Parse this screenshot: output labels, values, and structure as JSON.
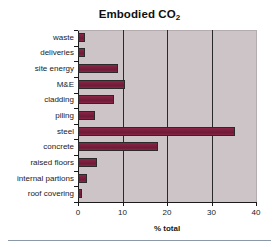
{
  "chart_data": {
    "type": "bar",
    "orientation": "horizontal",
    "title": "Embodied CO2",
    "title_main": "Embodied CO",
    "title_subscript": "2",
    "xlabel": "% total",
    "ylabel": "",
    "xlim": [
      0,
      40
    ],
    "xticks": [
      "0",
      "10",
      "20",
      "30",
      "40"
    ],
    "xtick_values": [
      0,
      10,
      20,
      30,
      40
    ],
    "gridlines": [
      10,
      20,
      30
    ],
    "grid": true,
    "legend": false,
    "bar_color": "#7a1f3d",
    "plot_background": "#ccc4c6",
    "figure_background": "#ffffff",
    "axis_color": "#1a1a1a",
    "categories": [
      "waste",
      "deliveries",
      "site energy",
      "M&E",
      "cladding",
      "piling",
      "steel",
      "concrete",
      "raised floors",
      "internal partions",
      "roof covering"
    ],
    "values": [
      1.6,
      1.6,
      9.0,
      10.5,
      8.0,
      3.8,
      35.3,
      18.0,
      4.3,
      2.0,
      0.9
    ]
  }
}
